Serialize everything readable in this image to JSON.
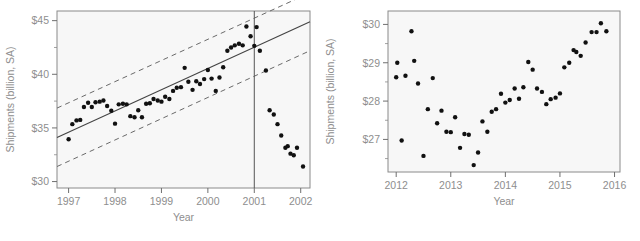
{
  "figure": {
    "panel_count": 2,
    "background": "#f7f7f7",
    "dot_color": "#111111",
    "label_color": "#8e8e8e"
  },
  "chart_data": [
    {
      "id": "left",
      "type": "scatter",
      "title": "",
      "xlabel": "Year",
      "ylabel": "Shipments (billion, SA)",
      "xlim": [
        1996.75,
        2002.2
      ],
      "ylim": [
        29.4,
        45.9
      ],
      "xticks": [
        1997,
        1998,
        1999,
        2000,
        2001,
        2002
      ],
      "xticklabels": [
        "1997",
        "1998",
        "1999",
        "2000",
        "2001",
        "2002"
      ],
      "yticks": [
        30,
        35,
        40,
        45
      ],
      "yticklabels": [
        "$30",
        "$35",
        "$40",
        "$45"
      ],
      "yminor": [
        32.5,
        37.5,
        42.5
      ],
      "grid": false,
      "legend": null,
      "annotations": [
        {
          "name": "forecast-divider",
          "type": "vline",
          "x": 2001
        }
      ],
      "fit_line": {
        "name": "regression-line",
        "style": "solid",
        "points": [
          [
            1996.75,
            34.1
          ],
          [
            2002.2,
            44.9
          ]
        ]
      },
      "bands": [
        {
          "name": "upper-prediction-band",
          "style": "dashed",
          "points": [
            [
              1996.75,
              36.85
            ],
            [
              2002.2,
              47.6
            ]
          ]
        },
        {
          "name": "lower-prediction-band",
          "style": "dashed",
          "points": [
            [
              1996.75,
              31.4
            ],
            [
              2002.2,
              42.2
            ]
          ]
        }
      ],
      "points": [
        [
          1997.0,
          33.95
        ],
        [
          1997.08,
          35.35
        ],
        [
          1997.17,
          35.7
        ],
        [
          1997.25,
          35.75
        ],
        [
          1997.33,
          36.95
        ],
        [
          1997.42,
          37.35
        ],
        [
          1997.5,
          36.95
        ],
        [
          1997.58,
          37.4
        ],
        [
          1997.67,
          37.45
        ],
        [
          1997.75,
          37.55
        ],
        [
          1997.83,
          37.05
        ],
        [
          1997.92,
          36.6
        ],
        [
          1998.0,
          35.4
        ],
        [
          1998.08,
          37.2
        ],
        [
          1998.17,
          37.25
        ],
        [
          1998.25,
          37.2
        ],
        [
          1998.33,
          36.1
        ],
        [
          1998.42,
          36.0
        ],
        [
          1998.5,
          36.65
        ],
        [
          1998.58,
          36.0
        ],
        [
          1998.67,
          37.25
        ],
        [
          1998.75,
          37.3
        ],
        [
          1998.83,
          37.7
        ],
        [
          1998.92,
          37.55
        ],
        [
          1999.0,
          37.45
        ],
        [
          1999.08,
          37.9
        ],
        [
          1999.17,
          37.7
        ],
        [
          1999.25,
          38.45
        ],
        [
          1999.33,
          38.75
        ],
        [
          1999.42,
          38.8
        ],
        [
          1999.5,
          40.6
        ],
        [
          1999.58,
          39.3
        ],
        [
          1999.67,
          38.55
        ],
        [
          1999.75,
          39.35
        ],
        [
          1999.83,
          39.1
        ],
        [
          1999.92,
          39.55
        ],
        [
          2000.0,
          40.4
        ],
        [
          2000.08,
          39.6
        ],
        [
          2000.17,
          38.45
        ],
        [
          2000.25,
          39.7
        ],
        [
          2000.33,
          40.65
        ],
        [
          2000.42,
          42.2
        ],
        [
          2000.5,
          42.5
        ],
        [
          2000.58,
          42.7
        ],
        [
          2000.67,
          42.85
        ],
        [
          2000.75,
          42.7
        ],
        [
          2000.83,
          44.45
        ],
        [
          2000.92,
          43.55
        ],
        [
          2001.0,
          42.65
        ],
        [
          2001.05,
          44.4
        ],
        [
          2001.12,
          42.2
        ],
        [
          2001.25,
          40.35
        ],
        [
          2001.33,
          36.65
        ],
        [
          2001.42,
          36.25
        ],
        [
          2001.5,
          35.35
        ],
        [
          2001.58,
          34.3
        ],
        [
          2001.67,
          33.15
        ],
        [
          2001.72,
          33.3
        ],
        [
          2001.78,
          32.6
        ],
        [
          2001.85,
          32.45
        ],
        [
          2001.92,
          33.15
        ],
        [
          2002.05,
          31.4
        ]
      ]
    },
    {
      "id": "right",
      "type": "scatter",
      "title": "",
      "xlabel": "Year",
      "ylabel": "Shipments (billion, SA)",
      "xlim": [
        2011.85,
        2016.1
      ],
      "ylim": [
        26.15,
        30.35
      ],
      "xticks": [
        2012,
        2013,
        2014,
        2015,
        2016
      ],
      "xticklabels": [
        "2012",
        "2013",
        "2014",
        "2015",
        "2016"
      ],
      "yticks": [
        27,
        28,
        29,
        30
      ],
      "yticklabels": [
        "$27",
        "$28",
        "$29",
        "$30"
      ],
      "yminor": [
        26.5,
        27.5,
        28.5,
        29.5
      ],
      "grid": false,
      "legend": null,
      "annotations": [],
      "points": [
        [
          2012.0,
          28.62
        ],
        [
          2012.02,
          29.0
        ],
        [
          2012.1,
          26.97
        ],
        [
          2012.17,
          28.66
        ],
        [
          2012.28,
          29.82
        ],
        [
          2012.33,
          29.05
        ],
        [
          2012.4,
          28.46
        ],
        [
          2012.5,
          26.57
        ],
        [
          2012.58,
          27.79
        ],
        [
          2012.67,
          28.6
        ],
        [
          2012.75,
          27.42
        ],
        [
          2012.83,
          27.75
        ],
        [
          2012.92,
          27.2
        ],
        [
          2013.0,
          27.19
        ],
        [
          2013.08,
          27.58
        ],
        [
          2013.17,
          26.78
        ],
        [
          2013.25,
          27.14
        ],
        [
          2013.33,
          27.12
        ],
        [
          2013.42,
          26.33
        ],
        [
          2013.5,
          26.66
        ],
        [
          2013.58,
          27.47
        ],
        [
          2013.67,
          27.2
        ],
        [
          2013.75,
          27.72
        ],
        [
          2013.83,
          27.79
        ],
        [
          2013.92,
          28.19
        ],
        [
          2014.0,
          27.96
        ],
        [
          2014.08,
          28.03
        ],
        [
          2014.17,
          28.33
        ],
        [
          2014.25,
          28.06
        ],
        [
          2014.33,
          28.36
        ],
        [
          2014.42,
          29.02
        ],
        [
          2014.5,
          28.82
        ],
        [
          2014.58,
          28.33
        ],
        [
          2014.67,
          28.24
        ],
        [
          2014.75,
          27.92
        ],
        [
          2014.83,
          28.05
        ],
        [
          2014.92,
          28.09
        ],
        [
          2015.0,
          28.2
        ],
        [
          2015.08,
          28.88
        ],
        [
          2015.17,
          29.0
        ],
        [
          2015.25,
          29.33
        ],
        [
          2015.3,
          29.28
        ],
        [
          2015.38,
          29.18
        ],
        [
          2015.47,
          29.53
        ],
        [
          2015.58,
          29.8
        ],
        [
          2015.67,
          29.8
        ],
        [
          2015.75,
          30.03
        ],
        [
          2015.85,
          29.82
        ]
      ]
    }
  ],
  "caption": ""
}
